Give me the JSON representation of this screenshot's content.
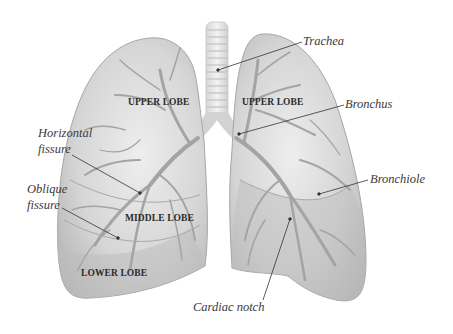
{
  "diagram": {
    "colors": {
      "background": "#ffffff",
      "lung_fill": "#c9c9c9",
      "lung_fill_light": "#e6e6e6",
      "lung_edge": "#9a9a9a",
      "airway": "#a8a8a8",
      "trachea": "#e4e4e4",
      "leader_line": "#333333",
      "lobe_text": "#2a2a2a",
      "callout_text": "#3a3a3a"
    },
    "lobe_labels": {
      "right_upper": "UPPER LOBE",
      "left_upper": "UPPER LOBE",
      "right_middle": "MIDDLE LOBE",
      "right_lower": "LOWER LOBE"
    },
    "callouts": {
      "trachea": "Trachea",
      "bronchus": "Bronchus",
      "horizontal_fissure_line1": "Horizontal",
      "horizontal_fissure_line2": "fissure",
      "oblique_fissure_line1": "Oblique",
      "oblique_fissure_line2": "fissure",
      "bronchiole": "Bronchiole",
      "cardiac_notch": "Cardiac notch"
    }
  }
}
